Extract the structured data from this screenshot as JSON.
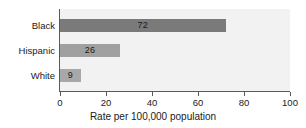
{
  "chart_data": {
    "type": "bar",
    "orientation": "horizontal",
    "title": "",
    "subtitle": "",
    "categories": [
      "Black",
      "Hispanic",
      "White"
    ],
    "values": [
      72,
      26,
      9
    ],
    "data_labels": [
      "72",
      "26",
      "9"
    ],
    "series": [
      {
        "name": "Rate per 100,000 population",
        "values": [
          72,
          26,
          9
        ]
      }
    ],
    "xlabel": "Rate per 100,000 population",
    "ylabel": "",
    "xlim": [
      0,
      100
    ],
    "xticks": [
      0,
      20,
      40,
      60,
      80,
      100
    ],
    "xtick_labels": [
      "0",
      "20",
      "40",
      "60",
      "80",
      "100"
    ],
    "grid": false,
    "legend": null,
    "bar_colors": [
      "#7a7a7a",
      "#a0a0a0",
      "#a8a8a8"
    ],
    "plot_background": "#f2f2f2",
    "axis_color": "#5a5a5a",
    "text_color": "#1a1a1a",
    "figure_background": "#ffffff"
  }
}
